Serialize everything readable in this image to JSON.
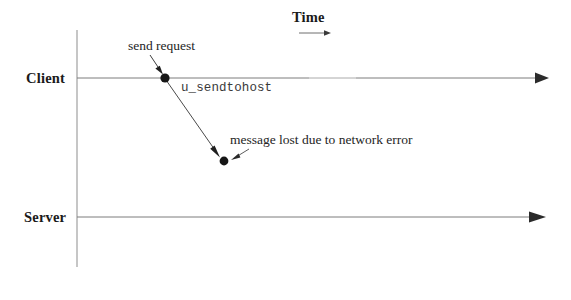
{
  "diagram": {
    "title_axis": "Time",
    "lifelines": [
      {
        "name": "Client",
        "label": "Client",
        "y": 78
      },
      {
        "name": "Server",
        "label": "Server",
        "y": 217
      }
    ],
    "annotations": [
      {
        "name": "send-request",
        "text": "send request"
      },
      {
        "name": "api-call",
        "text": "u_sendtohost"
      },
      {
        "name": "message-lost",
        "text": "message lost due to network error"
      }
    ],
    "events": [
      {
        "name": "send-event-dot",
        "on": "Client",
        "x": 165,
        "y": 78
      },
      {
        "name": "lost-message-dot",
        "x": 224,
        "y": 161
      }
    ],
    "message_arrow": {
      "name": "lost-message-arrow",
      "from_x": 166,
      "from_y": 80,
      "to_x": 219,
      "to_y": 156
    },
    "colors": {
      "line": "#7a7a7a",
      "ink": "#1a1a1a",
      "code": "#3a3a3a",
      "background": "#ffffff"
    },
    "geometry": {
      "vertical_axis_x": 77,
      "vertical_axis_top": 30,
      "vertical_axis_bottom": 267,
      "lifeline_end_x": 548,
      "time_arrow_x1": 299,
      "time_arrow_x2": 330,
      "time_arrow_y": 33
    }
  }
}
